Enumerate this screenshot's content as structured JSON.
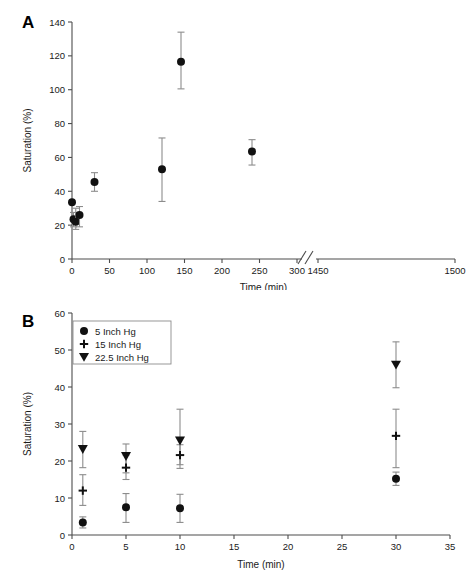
{
  "figure": {
    "panel_a_label": "A",
    "panel_b_label": "B"
  },
  "chart_data": [
    {
      "panel": "A",
      "type": "scatter",
      "title": "",
      "xlabel": "Time (min)",
      "ylabel": "Saturation (%)",
      "xlim": [
        0,
        1500
      ],
      "ylim": [
        0,
        140
      ],
      "xticks": [
        0,
        50,
        100,
        150,
        200,
        250,
        300,
        1450,
        1500
      ],
      "xticklabels": [
        "0",
        "50",
        "100",
        "150",
        "200",
        "250",
        "300",
        "1450",
        "1500"
      ],
      "yticks": [
        0,
        20,
        40,
        60,
        80,
        100,
        120,
        140
      ],
      "yticklabels": [
        "0",
        "20",
        "40",
        "60",
        "80",
        "100",
        "120",
        "140"
      ],
      "axis_break": {
        "after": 300,
        "before": 1450,
        "style": "double-slash"
      },
      "grid": false,
      "legend": "none",
      "series": [
        {
          "name": "saturation",
          "marker": "circle",
          "points": [
            {
              "x": 0,
              "y": 33.5,
              "yerr_low": 33.5,
              "yerr_high": 33.5
            },
            {
              "x": 2,
              "y": 23.5,
              "yerr_low": 19.0,
              "yerr_high": 27.5
            },
            {
              "x": 5,
              "y": 22.0,
              "yerr_low": 17.5,
              "yerr_high": 30.0
            },
            {
              "x": 10,
              "y": 26.0,
              "yerr_low": 19.0,
              "yerr_high": 31.0
            },
            {
              "x": 30,
              "y": 45.5,
              "yerr_low": 40.0,
              "yerr_high": 51.0
            },
            {
              "x": 120,
              "y": 53.0,
              "yerr_low": 34.0,
              "yerr_high": 71.5
            },
            {
              "x": 240,
              "y": 63.5,
              "yerr_low": 55.5,
              "yerr_high": 70.5
            },
            {
              "x": 1400,
              "y": 116.5,
              "yerr_low": 100.5,
              "yerr_high": 134.0
            }
          ]
        }
      ]
    },
    {
      "panel": "B",
      "type": "scatter",
      "title": "",
      "xlabel": "Time (min)",
      "ylabel": "Saturation (%)",
      "xlim": [
        0,
        35
      ],
      "ylim": [
        0,
        60
      ],
      "xticks": [
        0,
        5,
        10,
        15,
        20,
        25,
        30,
        35
      ],
      "xticklabels": [
        "0",
        "5",
        "10",
        "15",
        "20",
        "25",
        "30",
        "35"
      ],
      "yticks": [
        0,
        10,
        20,
        30,
        40,
        50,
        60
      ],
      "yticklabels": [
        "0",
        "10",
        "20",
        "30",
        "40",
        "50",
        "60"
      ],
      "grid": false,
      "legend_position": "top-left",
      "series": [
        {
          "name": "5 Inch Hg",
          "marker": "circle",
          "points": [
            {
              "x": 1,
              "y": 3.4,
              "yerr_low": 1.9,
              "yerr_high": 4.9
            },
            {
              "x": 5,
              "y": 7.5,
              "yerr_low": 3.4,
              "yerr_high": 11.2
            },
            {
              "x": 10,
              "y": 7.2,
              "yerr_low": 3.4,
              "yerr_high": 11.0
            },
            {
              "x": 30,
              "y": 15.2,
              "yerr_low": 13.4,
              "yerr_high": 17.0
            }
          ]
        },
        {
          "name": "15 Inch Hg",
          "marker": "plus",
          "points": [
            {
              "x": 1,
              "y": 12.0,
              "yerr_low": 8.0,
              "yerr_high": 16.3
            },
            {
              "x": 5,
              "y": 18.2,
              "yerr_low": 15.0,
              "yerr_high": 21.6
            },
            {
              "x": 10,
              "y": 21.6,
              "yerr_low": 19.0,
              "yerr_high": 24.4
            },
            {
              "x": 30,
              "y": 26.8,
              "yerr_low": 18.2,
              "yerr_high": 34.0
            }
          ]
        },
        {
          "name": "22.5 Inch Hg",
          "marker": "triangle-down",
          "points": [
            {
              "x": 1,
              "y": 23.2,
              "yerr_low": 18.2,
              "yerr_high": 28.0
            },
            {
              "x": 5,
              "y": 21.3,
              "yerr_low": 16.8,
              "yerr_high": 24.6
            },
            {
              "x": 10,
              "y": 25.5,
              "yerr_low": 18.0,
              "yerr_high": 34.0
            },
            {
              "x": 30,
              "y": 46.0,
              "yerr_low": 39.8,
              "yerr_high": 52.2
            }
          ]
        }
      ]
    }
  ]
}
